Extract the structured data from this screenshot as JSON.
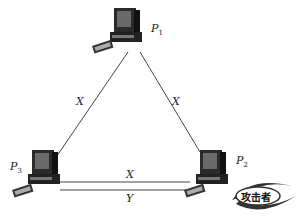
{
  "diagram": {
    "nodes": [
      {
        "id": "P1",
        "label": "P",
        "sub": "1"
      },
      {
        "id": "P2",
        "label": "P",
        "sub": "2"
      },
      {
        "id": "P3",
        "label": "P",
        "sub": "3"
      }
    ],
    "edges": [
      {
        "from": "P1",
        "to": "P3",
        "label": "X"
      },
      {
        "from": "P1",
        "to": "P2",
        "label": "X"
      },
      {
        "from": "P3",
        "to": "P2",
        "label": "X"
      },
      {
        "from": "P3",
        "to": "P2",
        "label": "Y"
      }
    ],
    "attacker_badge": {
      "text": "攻击者"
    },
    "colors": {
      "line": "#444444",
      "computer": "#2a2a2a",
      "screen": "#6a6a6a"
    }
  }
}
